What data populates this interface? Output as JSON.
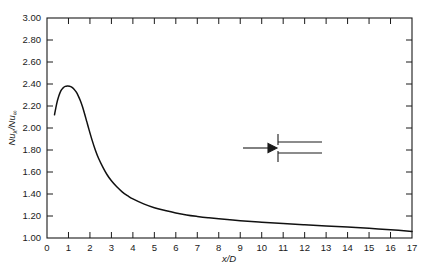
{
  "chart_data": {
    "type": "line",
    "title": "",
    "subtitle": "",
    "xlabel": "x/D",
    "ylabel": "Nu_x/Nu_∞",
    "ylabel_parts": {
      "main1": "Nu",
      "sub1": "x",
      "slash": "/Nu",
      "sub2": "∞"
    },
    "xlabel_parts": {
      "numerator": "x",
      "denominator": "/D"
    },
    "xlim": [
      0,
      17
    ],
    "ylim": [
      1.0,
      3.0
    ],
    "xticks": [
      0,
      1,
      2,
      3,
      4,
      5,
      6,
      7,
      8,
      9,
      10,
      11,
      12,
      13,
      14,
      15,
      16,
      17
    ],
    "xtick_labels": [
      "0",
      "1",
      "2",
      "3",
      "4",
      "5",
      "6",
      "7",
      "8",
      "9",
      "10",
      "11",
      "12",
      "13",
      "14",
      "15",
      "16",
      "17"
    ],
    "yticks": [
      1.0,
      1.2,
      1.4,
      1.6,
      1.8,
      2.0,
      2.2,
      2.4,
      2.6,
      2.8,
      3.0
    ],
    "ytick_labels": [
      "1.00",
      "1.20",
      "1.40",
      "1.60",
      "1.80",
      "2.00",
      "2.20",
      "2.40",
      "2.60",
      "2.80",
      "3.00"
    ],
    "grid": false,
    "legend": "none",
    "ticks_direction": "inward",
    "frame": "box",
    "series": [
      {
        "name": "local Nusselt number ratio",
        "x": [
          0.35,
          0.45,
          0.55,
          0.65,
          0.75,
          0.85,
          0.95,
          1.05,
          1.15,
          1.25,
          1.35,
          1.45,
          1.55,
          1.65,
          1.75,
          1.85,
          1.95,
          2.1,
          2.25,
          2.4,
          2.6,
          2.8,
          3.0,
          3.25,
          3.5,
          3.75,
          4.0,
          4.5,
          5.0,
          5.5,
          6.0,
          6.5,
          7.0,
          7.5,
          8.0,
          9.0,
          10.0,
          11.0,
          12.0,
          13.0,
          14.0,
          15.0,
          16.0,
          17.0
        ],
        "y": [
          2.12,
          2.22,
          2.29,
          2.34,
          2.365,
          2.378,
          2.382,
          2.38,
          2.372,
          2.355,
          2.33,
          2.295,
          2.25,
          2.195,
          2.13,
          2.06,
          1.99,
          1.89,
          1.8,
          1.725,
          1.645,
          1.575,
          1.52,
          1.465,
          1.42,
          1.385,
          1.355,
          1.31,
          1.275,
          1.25,
          1.228,
          1.21,
          1.196,
          1.184,
          1.174,
          1.157,
          1.143,
          1.131,
          1.12,
          1.11,
          1.1,
          1.088,
          1.075,
          1.06
        ]
      }
    ],
    "annotations": [
      {
        "name": "pipe-entrance-schematic",
        "type": "inset-diagram",
        "description": "flow arrow entering a parallel-wall duct / pipe entrance",
        "x_data": 10.0,
        "y_data": 1.82
      }
    ]
  },
  "figure": {
    "background_color": "#ffffff",
    "axis_color": "#1a1a1a",
    "curve_color": "#111111"
  }
}
